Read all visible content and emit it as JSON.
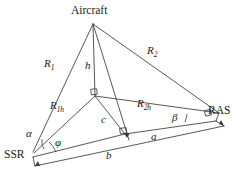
{
  "figure": {
    "type": "geometry-diagram",
    "stroke_color": "#3a3a3a",
    "text_color": "#1a1a1a",
    "background_color": "#ffffff"
  },
  "nodes": {
    "aircraft": {
      "label": "Aircraft",
      "x": 93,
      "y": 22
    },
    "ssr": {
      "label": "SSR",
      "x": 32,
      "y": 155
    },
    "ras": {
      "label": "RAS",
      "x": 221,
      "y": 111
    },
    "ground_projection": {
      "label": "",
      "x": 95,
      "y": 96
    },
    "foot_point": {
      "label": "",
      "x": 125,
      "y": 135
    }
  },
  "segments": {
    "r1": {
      "label": "R",
      "subscript": "1",
      "from": "aircraft",
      "to": "ssr"
    },
    "r2": {
      "label": "R",
      "subscript": "2",
      "from": "aircraft",
      "to": "ras"
    },
    "r1h": {
      "label": "R",
      "subscript": "1h",
      "from": "ground_projection",
      "to": "ssr"
    },
    "r2h": {
      "label": "R",
      "subscript": "2h",
      "from": "ground_projection",
      "to": "ras"
    },
    "h": {
      "label": "h",
      "subscript": "",
      "from": "aircraft",
      "to": "ground_projection"
    },
    "c": {
      "label": "c",
      "subscript": "",
      "from": "ground_projection",
      "to": "foot_point"
    },
    "a": {
      "label": "a",
      "subscript": "",
      "from": "foot_point",
      "to": "ras"
    },
    "b": {
      "label": "b",
      "subscript": "",
      "from": "ssr",
      "to": "ras"
    }
  },
  "angles": {
    "alpha": {
      "label": "α",
      "at": "ssr"
    },
    "beta": {
      "label": "β",
      "at": "ras"
    },
    "phi": {
      "label": "φ",
      "at": "ssr"
    }
  },
  "markers": {
    "right_angle_count": 3,
    "arrowhead_count": 2
  }
}
